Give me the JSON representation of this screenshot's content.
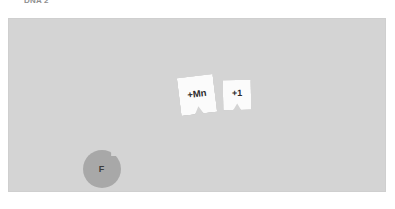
{
  "header": {
    "label": "DNA 2"
  },
  "canvas": {
    "background_color": "#d4d4d4",
    "border_color": "#cfcfcf"
  },
  "tokens": {
    "cards": [
      {
        "name": "card-mn",
        "label": "+Mn",
        "face_color": "#fbfbfb",
        "text_color": "#2b2b2b"
      },
      {
        "name": "card-plus-one",
        "label": "+1",
        "face_color": "#fbfbfb",
        "text_color": "#2b2b2b"
      }
    ],
    "circle": {
      "name": "token-f",
      "label": "F",
      "fill_color": "#a8a8a8",
      "text_color": "#3c3c3c"
    }
  }
}
